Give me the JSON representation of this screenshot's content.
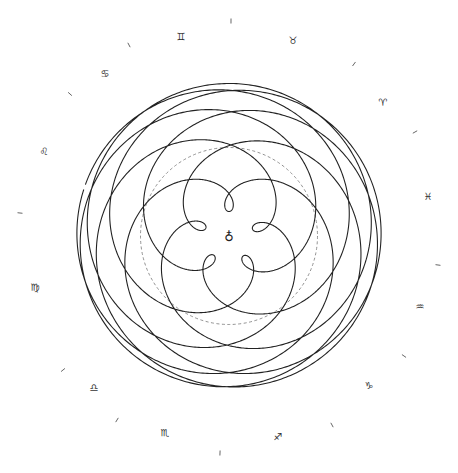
{
  "diagram": {
    "center": {
      "x": 229,
      "y": 236
    },
    "scale_px_per_au": 88.5,
    "center_symbol": "♁",
    "center_symbol_name": "earth-symbol",
    "sun_orbit": {
      "radius_au": 1.0,
      "style": "dashed",
      "color": "#777777"
    },
    "venus": {
      "orbit_radius_au": 0.7233,
      "period_days": 224.701,
      "earth_period_days": 365.256,
      "duration_days": 2920,
      "inferior_conjunction_angle_deg": 90,
      "stroke_color": "#222222",
      "stroke_width": 1.1
    },
    "zodiac_ring": {
      "label_radius_px": 205,
      "tick_radius_px": 212,
      "signs": [
        {
          "symbol": "♊",
          "name": "gemini",
          "x": 181,
          "y": 40
        },
        {
          "symbol": "♉",
          "name": "taurus",
          "x": 293,
          "y": 44
        },
        {
          "symbol": "♈",
          "name": "aries",
          "x": 383,
          "y": 106
        },
        {
          "symbol": "♓",
          "name": "pisces",
          "x": 428,
          "y": 200
        },
        {
          "symbol": "♒",
          "name": "aquarius",
          "x": 420,
          "y": 310
        },
        {
          "symbol": "♑",
          "name": "capricorn",
          "x": 369,
          "y": 389
        },
        {
          "symbol": "♐",
          "name": "sagittarius",
          "x": 278,
          "y": 440
        },
        {
          "symbol": "♏",
          "name": "scorpio",
          "x": 165,
          "y": 436
        },
        {
          "symbol": "♎",
          "name": "libra",
          "x": 94,
          "y": 391
        },
        {
          "symbol": "♍",
          "name": "virgo",
          "x": 35,
          "y": 291
        },
        {
          "symbol": "♌",
          "name": "leo",
          "x": 44,
          "y": 155
        },
        {
          "symbol": "♋",
          "name": "cancer",
          "x": 105,
          "y": 77
        }
      ],
      "ticks": [
        {
          "x": 231,
          "y": 21,
          "angle": 90
        },
        {
          "x": 354,
          "y": 64,
          "angle": 60
        },
        {
          "x": 415,
          "y": 132,
          "angle": 30
        },
        {
          "x": 438,
          "y": 265,
          "angle": 0
        },
        {
          "x": 404,
          "y": 356,
          "angle": -30
        },
        {
          "x": 332,
          "y": 425,
          "angle": -60
        },
        {
          "x": 220,
          "y": 453,
          "angle": -90
        },
        {
          "x": 117,
          "y": 420,
          "angle": -120
        },
        {
          "x": 63,
          "y": 370,
          "angle": -150
        },
        {
          "x": 20,
          "y": 213,
          "angle": 180
        },
        {
          "x": 70,
          "y": 94,
          "angle": 150
        },
        {
          "x": 129,
          "y": 45,
          "angle": 120
        }
      ]
    }
  }
}
